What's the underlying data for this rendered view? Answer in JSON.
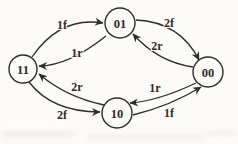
{
  "diagram": {
    "type": "state-transition-diagram",
    "nodes": [
      {
        "id": "01",
        "label": "01"
      },
      {
        "id": "11",
        "label": "11"
      },
      {
        "id": "00",
        "label": "00"
      },
      {
        "id": "10",
        "label": "10"
      }
    ],
    "edges": [
      {
        "from": "11",
        "to": "01",
        "label": "1f"
      },
      {
        "from": "01",
        "to": "11",
        "label": "1r"
      },
      {
        "from": "01",
        "to": "00",
        "label": "2f"
      },
      {
        "from": "00",
        "to": "01",
        "label": "2r"
      },
      {
        "from": "10",
        "to": "11",
        "label": "2r"
      },
      {
        "from": "11",
        "to": "10",
        "label": "2f"
      },
      {
        "from": "00",
        "to": "10",
        "label": "1r"
      },
      {
        "from": "10",
        "to": "00",
        "label": "1f"
      }
    ],
    "colors": {
      "ink": "#2e2c29",
      "background": "#fcfbf8"
    }
  }
}
